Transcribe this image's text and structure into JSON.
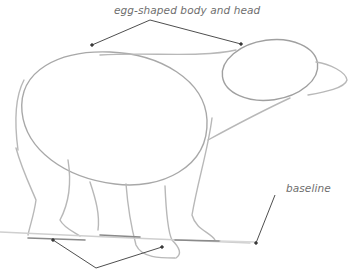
{
  "illustration": {
    "subject": "bear sketch",
    "annotations": {
      "top": "egg-shaped body and head",
      "right": "baseline"
    },
    "colors": {
      "sketch": "#b4b4b4",
      "sketch_dark": "#8a8a8a",
      "callout": "#3a3a3a",
      "label": "#6e6e6e"
    }
  }
}
